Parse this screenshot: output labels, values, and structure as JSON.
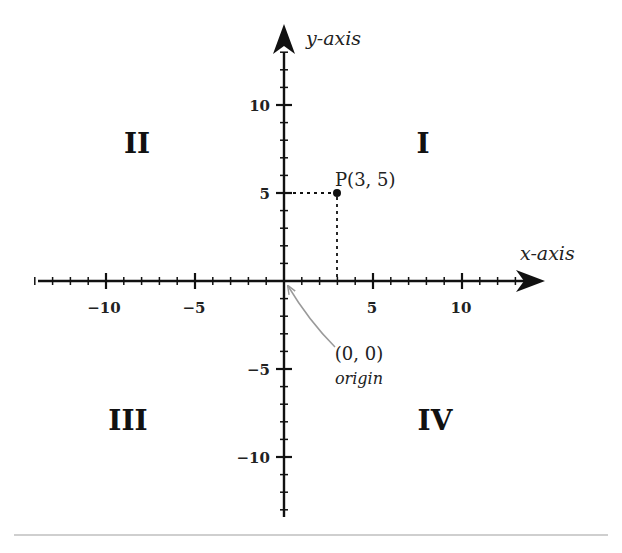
{
  "diagram": {
    "type": "cartesian-coordinate-plane",
    "axes": {
      "x_title": "x-axis",
      "y_title": "y-axis",
      "x_range": [
        -14,
        14
      ],
      "y_range": [
        -13,
        13
      ],
      "x_tick_labels": [
        "−10",
        "−5",
        "5",
        "10"
      ],
      "y_tick_labels": [
        "10",
        "5",
        "−5",
        "−10"
      ],
      "major_tick_values": [
        -10,
        -5,
        5,
        10
      ],
      "minor_tick_step": 1
    },
    "quadrants": {
      "I": "I",
      "II": "II",
      "III": "III",
      "IV": "IV"
    },
    "point": {
      "label": "P(3, 5)",
      "x": 3,
      "y": 5
    },
    "origin": {
      "coords_label": "(0, 0)",
      "caption": "origin"
    },
    "colors": {
      "axis": "#111111",
      "text": "#222222",
      "annotation_arrow": "#9a9a9a",
      "rule": "#cfcfcf"
    }
  }
}
